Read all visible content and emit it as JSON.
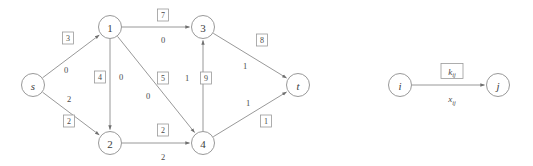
{
  "figure": {
    "title": "",
    "type": "flow-network-diagram",
    "colors": {
      "stroke": "#8d8d8d",
      "text": "#4a4a4a",
      "background": "#ffffff",
      "box_border": "#9a9a9a"
    }
  },
  "graph": {
    "nodes": [
      {
        "id": "s",
        "label": "s",
        "x": 33,
        "y": 85,
        "italic": true
      },
      {
        "id": "n1",
        "label": "1",
        "x": 110,
        "y": 27,
        "italic": false
      },
      {
        "id": "n2",
        "label": "2",
        "x": 110,
        "y": 143,
        "italic": false
      },
      {
        "id": "n3",
        "label": "3",
        "x": 203,
        "y": 27,
        "italic": false
      },
      {
        "id": "n4",
        "label": "4",
        "x": 203,
        "y": 143,
        "italic": false
      },
      {
        "id": "t",
        "label": "t",
        "x": 298,
        "y": 85,
        "italic": true
      }
    ],
    "edges": [
      {
        "id": "s-1",
        "from": "s",
        "to": "n1",
        "capacity": "3",
        "flow": "0",
        "cap_x": 68,
        "cap_y": 38,
        "flow_x": 66,
        "flow_y": 70
      },
      {
        "id": "s-2",
        "from": "s",
        "to": "n2",
        "capacity": "2",
        "flow": "2",
        "cap_x": 69,
        "cap_y": 121,
        "flow_x": 69,
        "flow_y": 99
      },
      {
        "id": "1-2",
        "from": "n1",
        "to": "n2",
        "capacity": "4",
        "flow": "0",
        "cap_x": 100,
        "cap_y": 77,
        "flow_x": 121,
        "flow_y": 77
      },
      {
        "id": "1-3",
        "from": "n1",
        "to": "n3",
        "capacity": "7",
        "flow": "0",
        "cap_x": 163,
        "cap_y": 15,
        "flow_x": 163,
        "flow_y": 40
      },
      {
        "id": "1-4",
        "from": "n1",
        "to": "n4",
        "capacity": "5",
        "flow": "0",
        "cap_x": 163,
        "cap_y": 78,
        "flow_x": 148,
        "flow_y": 96
      },
      {
        "id": "2-4",
        "from": "n2",
        "to": "n4",
        "capacity": "2",
        "flow": "2",
        "cap_x": 163,
        "cap_y": 130,
        "flow_x": 163,
        "flow_y": 157
      },
      {
        "id": "4-3",
        "from": "n4",
        "to": "n3",
        "capacity": "9",
        "flow": "1",
        "cap_x": 206,
        "cap_y": 78,
        "flow_x": 187,
        "flow_y": 78
      },
      {
        "id": "3-t",
        "from": "n3",
        "to": "t",
        "capacity": "8",
        "flow": "1",
        "cap_x": 262,
        "cap_y": 40,
        "flow_x": 245,
        "flow_y": 66
      },
      {
        "id": "4-t",
        "from": "n4",
        "to": "t",
        "capacity": "1",
        "flow": "1",
        "cap_x": 266,
        "cap_y": 121,
        "flow_x": 248,
        "flow_y": 103
      }
    ]
  },
  "legend": {
    "from_node": {
      "label": "i",
      "x": 400,
      "y": 85
    },
    "to_node": {
      "label": "j",
      "x": 498,
      "y": 85
    },
    "capacity_label": {
      "base": "k",
      "sub": "ij",
      "x": 452,
      "y": 71
    },
    "flow_label": {
      "base": "x",
      "sub": "ij",
      "x": 452,
      "y": 99
    }
  }
}
